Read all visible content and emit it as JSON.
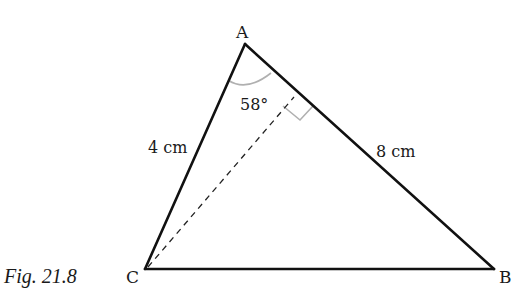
{
  "figure": {
    "caption": "Fig. 21.8",
    "type": "triangle",
    "vertices": {
      "A": {
        "label": "A",
        "x": 245,
        "y": 44
      },
      "B": {
        "label": "B",
        "x": 494,
        "y": 269
      },
      "C": {
        "label": "C",
        "x": 145,
        "y": 269
      }
    },
    "sides": {
      "AC": {
        "label": "4 cm"
      },
      "AB": {
        "label": "8 cm"
      },
      "CB": {
        "label": ""
      }
    },
    "angle_A": {
      "label": "58°"
    },
    "altitude": {
      "from": "C",
      "to": "AB",
      "style": "dashed",
      "right_angle_marker": true
    },
    "colors": {
      "stroke": "#111111",
      "construction": "#b0b0b0",
      "text": "#1a1a1a"
    }
  }
}
